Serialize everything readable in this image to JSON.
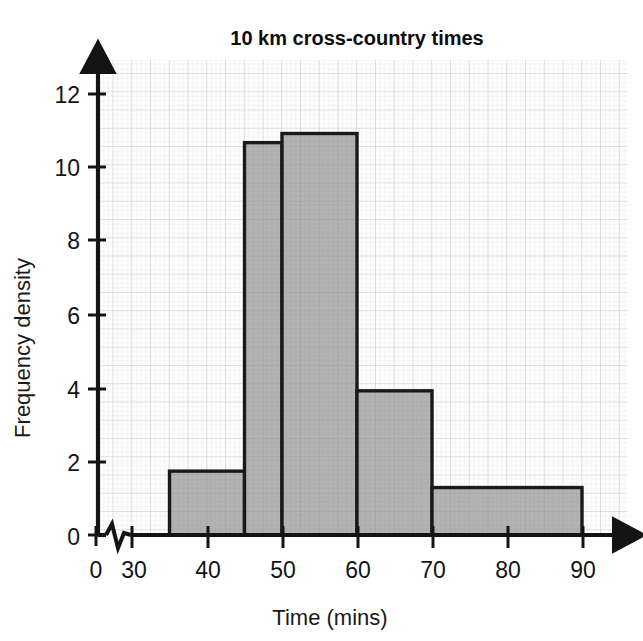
{
  "chart_data": {
    "type": "bar",
    "title": "10 km cross-country times",
    "xlabel": "Time (mins)",
    "ylabel": "Frequency density",
    "xlim": [
      30,
      95
    ],
    "ylim": [
      0,
      13
    ],
    "x_axis_break": true,
    "grid": true,
    "legend": "none",
    "x_tick_labels": [
      "0",
      "30",
      "40",
      "50",
      "60",
      "70",
      "80",
      "90"
    ],
    "x_tick_values": [
      0,
      30,
      40,
      50,
      60,
      70,
      80,
      90
    ],
    "y_tick_labels": [
      "0",
      "2",
      "4",
      "6",
      "8",
      "10",
      "12"
    ],
    "y_tick_values": [
      0,
      2,
      4,
      6,
      8,
      10,
      12
    ],
    "bars": [
      {
        "label": "35-45",
        "x_start": 35,
        "x_end": 45,
        "value": 1.75,
        "frequency": 17.5
      },
      {
        "label": "45-50",
        "x_start": 45,
        "x_end": 50,
        "value": 10.75,
        "frequency": 53.75
      },
      {
        "label": "50-60",
        "x_start": 50,
        "x_end": 60,
        "value": 11.0,
        "frequency": 110
      },
      {
        "label": "60-70",
        "x_start": 60,
        "x_end": 70,
        "value": 3.95,
        "frequency": 39.5
      },
      {
        "label": "70-90",
        "x_start": 70,
        "x_end": 90,
        "value": 1.3,
        "frequency": 26
      }
    ],
    "colors": {
      "bar_fill": "#b4b4b4",
      "bar_stroke": "#1a1a1a",
      "axis": "#141414",
      "grid_minor": "#e4e4e4",
      "grid_major": "#c9c9c9",
      "background": "#ffffff"
    }
  }
}
